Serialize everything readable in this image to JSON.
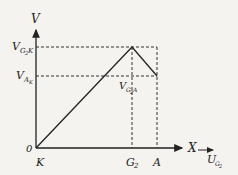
{
  "diagram": {
    "axes": {
      "y_label": "V",
      "x_label": "X",
      "origin_label": "0"
    },
    "y_ticks": [
      {
        "main": "V",
        "sub": "G",
        "subsub": "2",
        "tail": "K",
        "id": "VG2K"
      },
      {
        "main": "V",
        "sub": "A",
        "subsub": "",
        "tail": "K",
        "id": "VAK"
      }
    ],
    "x_ticks": [
      {
        "main": "K",
        "sub": ""
      },
      {
        "main": "G",
        "sub": "2"
      },
      {
        "main": "A",
        "sub": ""
      }
    ],
    "annotation": {
      "main": "V",
      "sub": "G",
      "subsub": "2",
      "tail": "A"
    },
    "corner_label": {
      "main": "U",
      "sub": "G",
      "subsub": "2"
    },
    "curve_points": [
      {
        "x": "K",
        "v": 0
      },
      {
        "x": "G2",
        "v": "VG2K"
      },
      {
        "x": "A",
        "v": "VAK"
      }
    ]
  }
}
